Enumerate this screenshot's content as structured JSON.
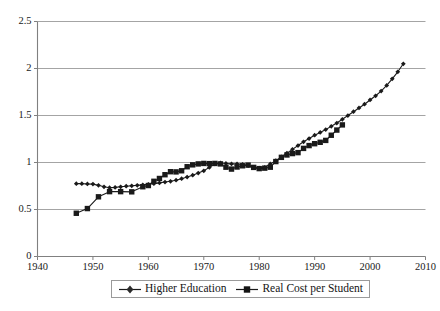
{
  "chart_data": {
    "type": "line",
    "title": "",
    "subtitle": "",
    "xlabel": "",
    "ylabel": "",
    "xlim": [
      1940,
      2010
    ],
    "ylim": [
      0,
      2.5
    ],
    "xticks": [
      1940,
      1950,
      1960,
      1970,
      1980,
      1990,
      2000,
      2010
    ],
    "yticks": [
      0,
      0.5,
      1,
      1.5,
      2,
      2.5
    ],
    "xtick_labels": [
      "1940",
      "1950",
      "1960",
      "1970",
      "1980",
      "1990",
      "2000",
      "2010"
    ],
    "ytick_labels": [
      "0",
      "0.5",
      "1",
      "1.5",
      "2",
      "2.5"
    ],
    "grid": "horizontal",
    "legend_position": "bottom-center",
    "colors": {
      "series": "#1a1a1a",
      "grid": "#9a9a9a",
      "axis": "#808080",
      "background": "#ffffff",
      "text": "#1a1a1a"
    },
    "series": [
      {
        "name": "Higher Education",
        "marker": "diamond",
        "x": [
          1947,
          1948,
          1949,
          1950,
          1951,
          1952,
          1953,
          1954,
          1955,
          1956,
          1957,
          1958,
          1959,
          1960,
          1961,
          1962,
          1963,
          1964,
          1965,
          1966,
          1967,
          1968,
          1969,
          1970,
          1971,
          1972,
          1973,
          1974,
          1975,
          1976,
          1977,
          1978,
          1979,
          1980,
          1981,
          1982,
          1983,
          1984,
          1985,
          1986,
          1987,
          1988,
          1989,
          1990,
          1991,
          1992,
          1993,
          1994,
          1995,
          1996,
          1997,
          1998,
          1999,
          2000,
          2001,
          2002,
          2003,
          2004,
          2005,
          2006
        ],
        "values": [
          0.775,
          0.775,
          0.772,
          0.77,
          0.757,
          0.742,
          0.732,
          0.735,
          0.742,
          0.748,
          0.752,
          0.757,
          0.762,
          0.768,
          0.775,
          0.783,
          0.792,
          0.8,
          0.812,
          0.828,
          0.845,
          0.865,
          0.888,
          0.912,
          0.948,
          0.985,
          0.995,
          0.99,
          0.985,
          0.985,
          0.98,
          0.968,
          0.945,
          0.94,
          0.948,
          0.985,
          1.02,
          1.06,
          1.1,
          1.14,
          1.18,
          1.22,
          1.255,
          1.29,
          1.32,
          1.35,
          1.385,
          1.42,
          1.46,
          1.5,
          1.54,
          1.58,
          1.62,
          1.665,
          1.71,
          1.76,
          1.82,
          1.89,
          1.965,
          2.05
        ]
      },
      {
        "name": "Real Cost per Student",
        "marker": "square",
        "x": [
          1947,
          1949,
          1951,
          1953,
          1955,
          1957,
          1959,
          1960,
          1961,
          1962,
          1963,
          1964,
          1965,
          1966,
          1967,
          1968,
          1969,
          1970,
          1971,
          1972,
          1973,
          1974,
          1975,
          1976,
          1977,
          1978,
          1979,
          1980,
          1981,
          1982,
          1983,
          1984,
          1985,
          1986,
          1987,
          1988,
          1989,
          1990,
          1991,
          1992,
          1993,
          1994,
          1995
        ],
        "values": [
          0.46,
          0.51,
          0.635,
          0.69,
          0.69,
          0.688,
          0.742,
          0.755,
          0.8,
          0.83,
          0.87,
          0.902,
          0.9,
          0.912,
          0.955,
          0.975,
          0.985,
          0.99,
          0.988,
          0.99,
          0.985,
          0.95,
          0.93,
          0.952,
          0.965,
          0.972,
          0.948,
          0.935,
          0.94,
          0.95,
          1.01,
          1.055,
          1.08,
          1.095,
          1.105,
          1.15,
          1.18,
          1.2,
          1.215,
          1.235,
          1.29,
          1.345,
          1.4
        ]
      }
    ]
  },
  "legend": {
    "entries": [
      {
        "label": "Higher Education",
        "marker": "diamond"
      },
      {
        "label": "Real Cost per Student",
        "marker": "square"
      }
    ]
  }
}
